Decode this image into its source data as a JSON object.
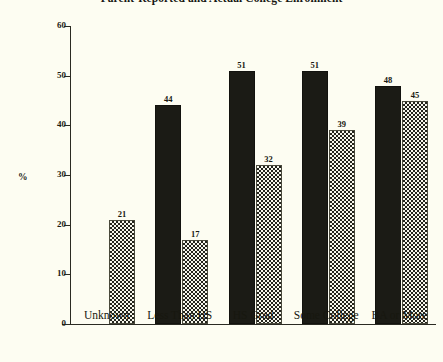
{
  "chart_data": {
    "type": "bar",
    "title": "Parent-Reported and Actual College Enrollment",
    "xlabel": "",
    "ylabel": "%",
    "ylim": [
      0,
      60
    ],
    "yticks": [
      "0",
      "10",
      "20",
      "30",
      "40",
      "50",
      "60"
    ],
    "grid": false,
    "legend": "none",
    "categories": [
      "Unknown",
      "Less Than HS",
      "HS Grad",
      "Some College",
      "BA or More"
    ],
    "series": [
      {
        "name": "Reported",
        "style": "solid-black",
        "values": [
          null,
          44,
          51,
          51,
          48
        ],
        "labels": [
          "",
          "44",
          "51",
          "51",
          "48"
        ]
      },
      {
        "name": "Actual",
        "style": "checkered",
        "values": [
          21,
          17,
          32,
          39,
          45
        ],
        "labels": [
          "21",
          "17",
          "32",
          "39",
          "45"
        ]
      }
    ]
  },
  "colors": {
    "background": "#fdfdf2",
    "axis": "#2a2a22",
    "solid_bar": "#1b1b15",
    "hatch_dark": "#23231c",
    "hatch_light": "#f7f7ec",
    "text": "#17170f"
  }
}
